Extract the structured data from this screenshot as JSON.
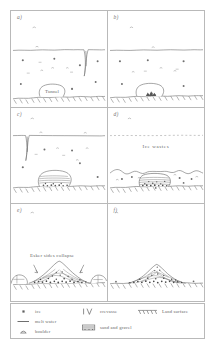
{
  "figure": {
    "panels": [
      {
        "id": "a",
        "label": "a)",
        "annotation": "Tunnel",
        "description": "Subglacial tunnel beneath ice sheet with crevasse reaching surface"
      },
      {
        "id": "b",
        "label": "b)",
        "annotation": "",
        "description": "Sand and gravel begins accumulating on tunnel floor"
      },
      {
        "id": "c",
        "label": "c)",
        "annotation": "",
        "description": "Tunnel filled with stratified sand and gravel"
      },
      {
        "id": "d",
        "label": "d)",
        "annotation": "Ice wastes",
        "description": "Ice surface lowers, sediment body emerges as ice wastes away"
      },
      {
        "id": "e",
        "label": "e)",
        "annotation": "Esker sides collapse",
        "description": "Remnant ice blocks melt, esker sides collapse outward"
      },
      {
        "id": "f",
        "label": "f)",
        "annotation": "",
        "description": "Final esker ridge on land surface"
      }
    ]
  },
  "legend": {
    "items": [
      {
        "symbol": "ice-symbol",
        "label": "ice"
      },
      {
        "symbol": "melt-water-symbol",
        "label": "melt water"
      },
      {
        "symbol": "boulder-symbol",
        "label": "boulder"
      },
      {
        "symbol": "crevasse-symbol",
        "label": "crevasse"
      },
      {
        "symbol": "sand-and-gravel-symbol",
        "label": "sand and gravel"
      },
      {
        "symbol": "land-surface-symbol",
        "label": "Land surface"
      }
    ]
  },
  "colors": {
    "ink": "#666666",
    "frame": "#b9b9b9",
    "background": "#ffffff",
    "sediment": "#707070"
  }
}
